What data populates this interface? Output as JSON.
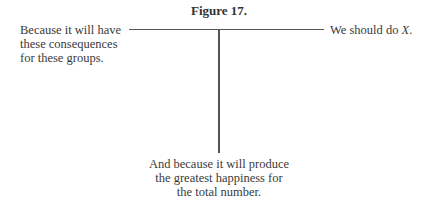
{
  "figure": {
    "title": "Figure 17.",
    "nodes": {
      "left": {
        "lines": [
          "Because it will have",
          "these consequences",
          "for these groups."
        ]
      },
      "right": {
        "prefix": "We should do ",
        "variable": "X",
        "suffix": "."
      },
      "bottom": {
        "lines": [
          "And because it will produce",
          "the greatest happiness for",
          "the total number."
        ]
      }
    }
  }
}
